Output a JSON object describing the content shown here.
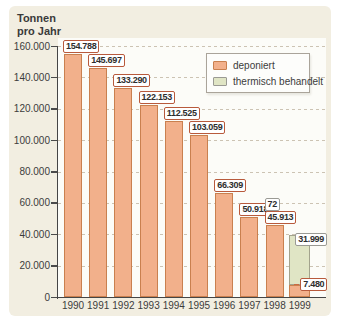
{
  "title": {
    "line1": "Tonnen",
    "line2": "pro Jahr"
  },
  "legend": {
    "items": [
      {
        "label": "deponiert",
        "swatch_color": "#f2b08b",
        "swatch_border": "#c9804f"
      },
      {
        "label": "thermisch behandelt",
        "swatch_color": "#e0e5c5",
        "swatch_border": "#9a9a94"
      }
    ]
  },
  "chart_data": {
    "type": "bar",
    "stacked": true,
    "title": "Tonnen pro Jahr",
    "categories": [
      "1990",
      "1991",
      "1992",
      "1993",
      "1994",
      "1995",
      "1996",
      "1997",
      "1998",
      "1999"
    ],
    "series": [
      {
        "name": "deponiert",
        "color": "#f2b08b",
        "border_color": "#c9804f",
        "values": [
          154788,
          145697,
          133290,
          122153,
          112525,
          103059,
          66309,
          50918,
          45913,
          7480
        ]
      },
      {
        "name": "thermisch behandelt",
        "color": "#e0e5c5",
        "border_color": "#a3a38d",
        "values": [
          0,
          0,
          0,
          0,
          0,
          0,
          0,
          0,
          72,
          31999
        ]
      }
    ],
    "value_labels": [
      [
        {
          "text": "154.788",
          "series": 0
        }
      ],
      [
        {
          "text": "145.697",
          "series": 0
        }
      ],
      [
        {
          "text": "133.290",
          "series": 0
        }
      ],
      [
        {
          "text": "122.153",
          "series": 0
        }
      ],
      [
        {
          "text": "112.525",
          "series": 0
        }
      ],
      [
        {
          "text": "103.059",
          "series": 0
        }
      ],
      [
        {
          "text": "66.309",
          "series": 0
        }
      ],
      [
        {
          "text": "50.918",
          "series": 0
        }
      ],
      [
        {
          "text": "72",
          "series": 1
        },
        {
          "text": "45.913",
          "series": 0
        }
      ],
      [
        {
          "text": "31.999",
          "series": 1
        },
        {
          "text": "7.480",
          "series": 0
        }
      ]
    ],
    "y_axis": {
      "ticks": [
        "0",
        "20.000",
        "40.000",
        "60.000",
        "80.000",
        "100.000",
        "120.000",
        "140.000",
        "160.000"
      ],
      "min": 0,
      "max": 160000,
      "step": 20000
    },
    "grid": {
      "horizontal": true,
      "style": "dashed"
    },
    "legend_position": "top-right",
    "label_border_colors": {
      "0": "#b85a3c",
      "1": "#9a9a94"
    }
  },
  "colors": {
    "page_bg": "#ffffff",
    "panel_bg": "#f2eee1",
    "plot_bg": "#fcfcf8",
    "axis": "#454545",
    "gridline": "#ccc3b3",
    "text": "#333333",
    "label_box_bg": "#ffffff"
  }
}
